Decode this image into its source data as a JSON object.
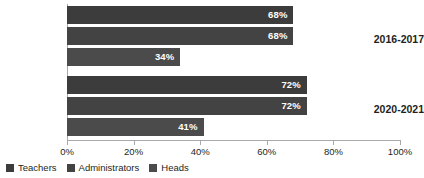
{
  "chart_data": {
    "type": "bar",
    "orientation": "horizontal",
    "title": "",
    "subtitle": "",
    "xlabel": "",
    "ylabel": "",
    "xlim": [
      0,
      100
    ],
    "xticks": [
      "0%",
      "20%",
      "40%",
      "60%",
      "80%",
      "100%"
    ],
    "xtick_values": [
      0,
      20,
      40,
      60,
      80,
      100
    ],
    "grid": false,
    "legend_position": "bottom-left",
    "categories": [
      "2016-2017",
      "2020-2021"
    ],
    "series": [
      {
        "name": "Teachers",
        "color": "#3c3c3c",
        "values": [
          68,
          72
        ],
        "labels": [
          "68%",
          "72%"
        ]
      },
      {
        "name": "Administrators",
        "color": "#434343",
        "values": [
          68,
          72
        ],
        "labels": [
          "68%",
          "72%"
        ]
      },
      {
        "name": "Heads",
        "color": "#4b4b4b",
        "values": [
          34,
          41
        ],
        "labels": [
          "34%",
          "41%"
        ]
      }
    ]
  },
  "axis": {
    "ticks": [
      {
        "label": "0%",
        "value": 0
      },
      {
        "label": "20%",
        "value": 20
      },
      {
        "label": "40%",
        "value": 40
      },
      {
        "label": "60%",
        "value": 60
      },
      {
        "label": "80%",
        "value": 80
      },
      {
        "label": "100%",
        "value": 100
      }
    ]
  },
  "colors": {
    "teachers": "#3c3c3c",
    "administrators": "#434343",
    "heads": "#4b4b4b",
    "axis": "#a7a9ac",
    "text": "#231f20",
    "label_text": "#ffffff",
    "background": "#ffffff"
  }
}
